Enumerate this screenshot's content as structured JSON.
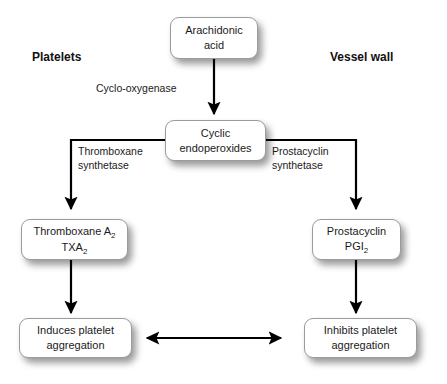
{
  "diagram": {
    "background_color": "#ffffff",
    "line_color": "#000000",
    "box_border_color": "#9b9b9b",
    "text_color": "#1a1a1a"
  },
  "columns": {
    "left_header": "Platelets",
    "right_header": "Vessel wall"
  },
  "nodes": {
    "arachidonic_acid": {
      "line1": "Arachidonic",
      "line2": "acid"
    },
    "cyclic_endoperoxides": {
      "line1": "Cyclic",
      "line2": "endoperoxides"
    },
    "thromboxane": {
      "line1_pre": "Thromboxane A",
      "line1_sub": "2",
      "line2_pre": "TXA",
      "line2_sub": "2"
    },
    "prostacyclin": {
      "line1": "Prostacyclin",
      "line2_pre": "PGI",
      "line2_sub": "2"
    },
    "induces": {
      "line1": "Induces platelet",
      "line2": "aggregation"
    },
    "inhibits": {
      "line1": "Inhibits platelet",
      "line2": "aggregation"
    }
  },
  "edge_labels": {
    "cyclo_oxygenase": "Cyclo-oxygenase",
    "thromboxane_synthetase_line1": "Thromboxane",
    "thromboxane_synthetase_line2": "synthetase",
    "prostacyclin_synthetase_line1": "Prostacyclin",
    "prostacyclin_synthetase_line2": "synthetase"
  }
}
